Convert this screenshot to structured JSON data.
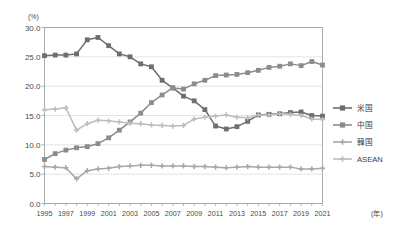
{
  "chart_data": {
    "type": "line",
    "title": "",
    "subtitle": "",
    "xlabel": "(年)",
    "ylabel": "(%)",
    "ylim": [
      0.0,
      30.0
    ],
    "yticks": [
      "0.0",
      "5.0",
      "10.0",
      "15.0",
      "20.0",
      "25.0",
      "30.0"
    ],
    "ytick_values": [
      0.0,
      5.0,
      10.0,
      15.0,
      20.0,
      25.0,
      30.0
    ],
    "grid": true,
    "grid_axis": "y",
    "legend_position": "right",
    "x": [
      1995,
      1996,
      1997,
      1998,
      1999,
      2000,
      2001,
      2002,
      2003,
      2004,
      2005,
      2006,
      2007,
      2008,
      2009,
      2010,
      2011,
      2012,
      2013,
      2014,
      2015,
      2016,
      2017,
      2018,
      2019,
      2020,
      2021
    ],
    "xtick_labels": [
      "1995",
      "1997",
      "1999",
      "2001",
      "2003",
      "2005",
      "2007",
      "2009",
      "2011",
      "2013",
      "2015",
      "2017",
      "2019",
      "2021"
    ],
    "xtick_values": [
      1995,
      1997,
      1999,
      2001,
      2003,
      2005,
      2007,
      2009,
      2011,
      2013,
      2015,
      2017,
      2019,
      2021
    ],
    "series": [
      {
        "name": "米国",
        "color": "#6e6e6e",
        "marker": "square",
        "values": [
          25.2,
          25.3,
          25.3,
          25.5,
          27.9,
          28.3,
          26.9,
          25.5,
          25.0,
          23.8,
          23.3,
          21.0,
          19.7,
          18.3,
          17.5,
          16.0,
          13.2,
          12.7,
          13.1,
          14.0,
          15.1,
          15.2,
          15.3,
          15.5,
          15.6,
          15.0,
          14.9
        ]
      },
      {
        "name": "中国",
        "color": "#8c8c8c",
        "marker": "square",
        "values": [
          7.5,
          8.5,
          9.1,
          9.5,
          9.7,
          10.2,
          11.2,
          12.5,
          13.9,
          15.4,
          17.2,
          18.5,
          19.7,
          19.5,
          20.4,
          21.0,
          21.8,
          21.9,
          22.0,
          22.3,
          22.7,
          23.2,
          23.4,
          23.8,
          23.5,
          24.2,
          23.6
        ]
      },
      {
        "name": "韓国",
        "color": "#a8a8a8",
        "marker": "cross",
        "values": [
          6.3,
          6.2,
          6.1,
          4.2,
          5.6,
          5.9,
          6.0,
          6.3,
          6.4,
          6.5,
          6.5,
          6.4,
          6.4,
          6.4,
          6.3,
          6.3,
          6.2,
          6.1,
          6.2,
          6.3,
          6.2,
          6.2,
          6.2,
          6.2,
          5.9,
          5.9,
          6.0
        ]
      },
      {
        "name": "ASEAN",
        "color": "#bdbdbd",
        "marker": "cross",
        "values": [
          16.0,
          16.1,
          16.3,
          12.5,
          13.6,
          14.2,
          14.1,
          13.9,
          13.7,
          13.6,
          13.4,
          13.3,
          13.2,
          13.3,
          14.4,
          14.7,
          14.9,
          15.1,
          14.7,
          14.6,
          15.1,
          15.1,
          15.3,
          15.2,
          15.0,
          14.4,
          14.3
        ]
      }
    ]
  },
  "legend": {
    "entries": [
      {
        "label": "米国"
      },
      {
        "label": "中国"
      },
      {
        "label": "韓国"
      },
      {
        "label": "ASEAN"
      }
    ]
  }
}
